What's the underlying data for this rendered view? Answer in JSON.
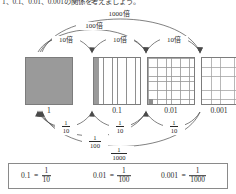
{
  "header": {
    "text": "1、0.1、0.01、0.001の関係を考えましょう。"
  },
  "multiply_arcs": [
    {
      "id": "m1000",
      "label": "1000倍"
    },
    {
      "id": "m100",
      "label": "100倍"
    },
    {
      "id": "m10a",
      "label": "10倍"
    },
    {
      "id": "m10b",
      "label": "10倍"
    },
    {
      "id": "m10c",
      "label": "10倍"
    }
  ],
  "divide_arcs": [
    {
      "id": "d10a",
      "num": "1",
      "den": "10"
    },
    {
      "id": "d10b",
      "num": "1",
      "den": "10"
    },
    {
      "id": "d10c",
      "num": "1",
      "den": "10"
    },
    {
      "id": "d100",
      "num": "1",
      "den": "100"
    },
    {
      "id": "d1000",
      "num": "1",
      "den": "1000"
    }
  ],
  "squares": [
    {
      "id": "sq-1",
      "label": "1",
      "kind": "solid"
    },
    {
      "id": "sq-01",
      "label": "0.1",
      "kind": "columns"
    },
    {
      "id": "sq-001",
      "label": "0.01",
      "kind": "grid10"
    },
    {
      "id": "sq-0001",
      "label": "0.001",
      "kind": "grid20"
    }
  ],
  "equations": [
    {
      "id": "eq-01",
      "decimal": "0.1",
      "equals": "=",
      "num": "1",
      "den": "10"
    },
    {
      "id": "eq-001",
      "decimal": "0.01",
      "equals": "=",
      "num": "1",
      "den": "100"
    },
    {
      "id": "eq-0001",
      "decimal": "0.001",
      "equals": "=",
      "num": "1",
      "den": "1000"
    }
  ],
  "colors": {
    "shade": "#9a9a9a",
    "line": "#7c7c7c",
    "arc": "#4a4a4a",
    "text": "#2b2b2b"
  }
}
